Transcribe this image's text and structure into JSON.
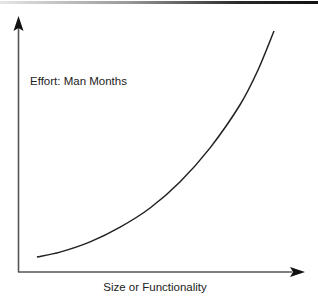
{
  "chart_data": {
    "type": "line",
    "title": "",
    "xlabel": "Size or Functionality",
    "ylabel": "Effort: Man Months",
    "xlim": [
      0,
      100
    ],
    "ylim": [
      0,
      100
    ],
    "grid": false,
    "legend": null,
    "ticks": "none",
    "series": [
      {
        "name": "Effort vs Size",
        "x": [
          6.6,
          14.7,
          25.2,
          35.7,
          46.2,
          56.6,
          67.1,
          77.6,
          83.9,
          89.5
        ],
        "y": [
          5.9,
          7.8,
          11.8,
          17.6,
          25.1,
          35.3,
          48.6,
          65.5,
          79.2,
          94.5
        ],
        "color": "#222222"
      }
    ],
    "annotations": [
      "axes drawn as arrows; no tick labels; values normalized 0-100"
    ]
  },
  "colors": {
    "axis": "#444444",
    "curve": "#222222",
    "text": "#222222"
  }
}
